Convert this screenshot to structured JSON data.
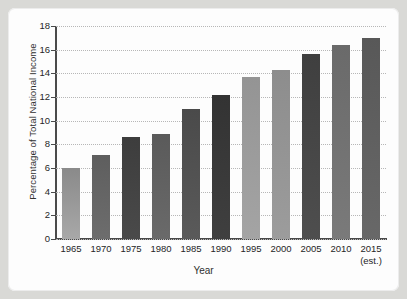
{
  "chart_data": {
    "type": "bar",
    "title": "",
    "subtitle": "",
    "xlabel": "Year",
    "ylabel": "Percentage of Total National Income",
    "categories": [
      "1965",
      "1970",
      "1975",
      "1980",
      "1985",
      "1990",
      "1995",
      "2000",
      "2005",
      "2010",
      "2015"
    ],
    "category_sublabels": [
      "",
      "",
      "",
      "",
      "",
      "",
      "",
      "",
      "",
      "",
      "(est.)"
    ],
    "values": [
      6.0,
      7.1,
      8.6,
      8.9,
      11.0,
      12.2,
      13.7,
      14.3,
      15.6,
      16.4,
      17.0
    ],
    "ylim": [
      0,
      18
    ],
    "ytick_values": [
      0,
      2,
      4,
      6,
      8,
      10,
      12,
      14,
      16,
      18
    ],
    "ytick_labels": [
      "0",
      "2",
      "4",
      "6",
      "8",
      "10",
      "12",
      "14",
      "16",
      "18"
    ],
    "grid": true,
    "grid_style": "dotted",
    "grid_color": "#b7b7b7",
    "legend": "none",
    "bar_colors_top": [
      "#8a8a8a",
      "#5e5e5e",
      "#3d3d3d",
      "#5a5a5a",
      "#4a4a4a",
      "#333333",
      "#949494",
      "#8d8d8d",
      "#3f3f3f",
      "#6a6a6a",
      "#585858"
    ],
    "bar_colors_bottom": [
      "#a8a8a8",
      "#6d6d6d",
      "#4a4a4a",
      "#6a6a6a",
      "#5a5a5a",
      "#3f3f3f",
      "#a4a4a4",
      "#9c9c9c",
      "#4e4e4e",
      "#7a7a7a",
      "#686868"
    ]
  },
  "figure": {
    "background_color": "#d9d9d6",
    "panel_color": "#fdfdfd",
    "axis_color": "#4a4a4a",
    "text_color": "#262626"
  }
}
